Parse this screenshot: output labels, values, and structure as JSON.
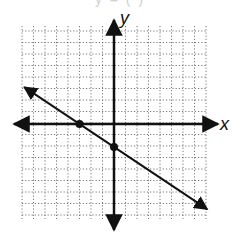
{
  "header": {
    "cut_text": "y   =   (      )"
  },
  "chart_data": {
    "type": "line",
    "title": "",
    "xlabel": "x",
    "ylabel": "y",
    "xlim": [
      -8,
      8
    ],
    "ylim": [
      -8,
      8
    ],
    "grid": true,
    "grid_style": "dotted",
    "series": [
      {
        "name": "line",
        "slope": -0.6667,
        "intercept": -2,
        "points": [
          [
            -3,
            0
          ],
          [
            0,
            -2
          ]
        ],
        "arrows": "both"
      }
    ],
    "marked_points": [
      {
        "x": -3,
        "y": 0,
        "label": "x-intercept"
      },
      {
        "x": 0,
        "y": -2,
        "label": "y-intercept"
      }
    ]
  },
  "colors": {
    "axis": "#111111",
    "grid": "#555555",
    "line": "#111111"
  }
}
